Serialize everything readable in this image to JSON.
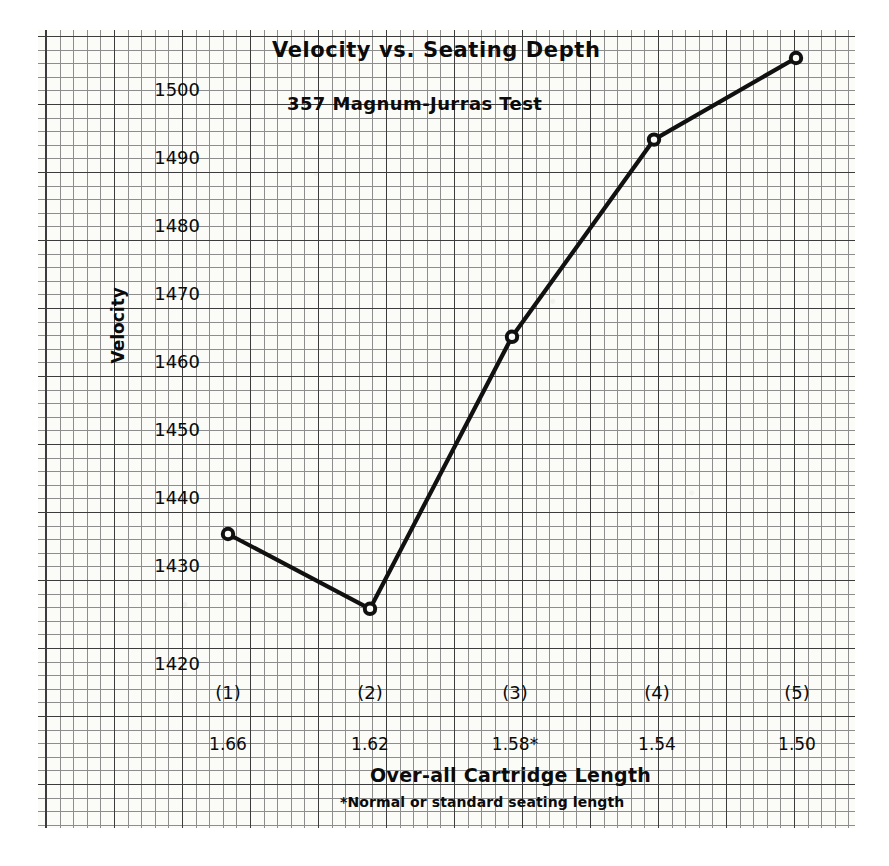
{
  "chart_data": {
    "type": "line",
    "title": "Velocity vs. Seating Depth",
    "subtitle": "357 Magnum-Jurras Test",
    "xlabel": "Over-all Cartridge Length",
    "ylabel": "Velocity",
    "footnote": "*Normal or standard seating length",
    "grid": true,
    "legend": "none",
    "ylim": [
      1414,
      1510
    ],
    "yticks": [
      1420,
      1430,
      1440,
      1450,
      1460,
      1470,
      1480,
      1490,
      1500
    ],
    "ytick_labels": [
      "1420",
      "1430",
      "1440",
      "1450",
      "1460",
      "1470",
      "1480",
      "1490",
      "1500"
    ],
    "categories": [
      "(1)",
      "(2)",
      "(3)",
      "(4)",
      "(5)"
    ],
    "xtick_labels": [
      "1.66",
      "1.62",
      "1.58*",
      "1.54",
      "1.50"
    ],
    "x": [
      1.66,
      1.62,
      1.58,
      1.54,
      1.5
    ],
    "values": [
      1435,
      1424,
      1464,
      1493,
      1505
    ],
    "series": [
      {
        "name": "Velocity",
        "values": [
          1435,
          1424,
          1464,
          1493,
          1505
        ],
        "marker": "open-circle",
        "color": "#111111"
      }
    ]
  },
  "axis": {
    "y_title": "Velocity",
    "x_title": "Over-all Cartridge Length",
    "footnote": "*Normal or standard seating length"
  },
  "header": {
    "title": "Velocity vs. Seating Depth",
    "subtitle": "357 Magnum-Jurras Test"
  }
}
